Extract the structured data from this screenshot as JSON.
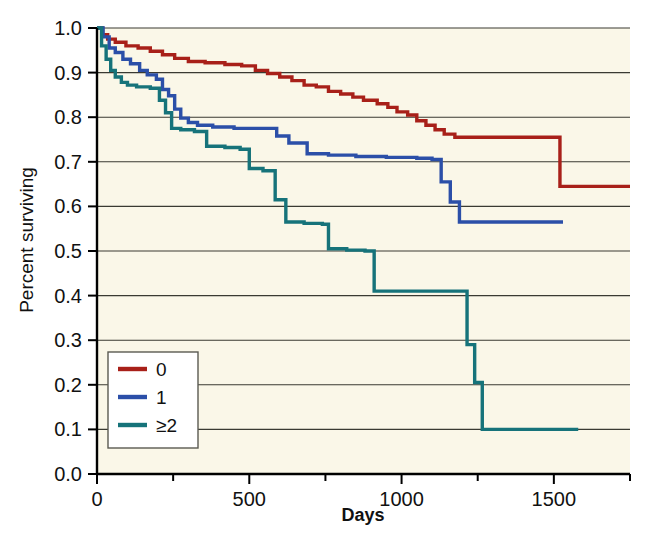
{
  "figure": {
    "background_color": "#ffffff",
    "plot_background_color": "#faf7e8"
  },
  "chart_data": {
    "type": "line",
    "subtype": "kaplan-meier-step",
    "title": "",
    "xlabel": "Days",
    "ylabel": "Percent surviving",
    "xlim": [
      0,
      1750
    ],
    "ylim": [
      0.0,
      1.0
    ],
    "grid": "horizontal",
    "xticks": [
      0,
      500,
      1000,
      1500
    ],
    "xtick_labels": [
      "0",
      "500",
      "1000",
      "1500"
    ],
    "xminor_ticks": [
      250,
      750,
      1250,
      1750
    ],
    "yticks": [
      0.0,
      0.1,
      0.2,
      0.3,
      0.4,
      0.5,
      0.6,
      0.7,
      0.8,
      0.9,
      1.0
    ],
    "ytick_labels": [
      "0.0",
      "0.1",
      "0.2",
      "0.3",
      "0.4",
      "0.5",
      "0.6",
      "0.7",
      "0.8",
      "0.9",
      "1.0"
    ],
    "legend_position": "lower-left",
    "legend_title": "",
    "series": [
      {
        "name": "0",
        "label": "0",
        "color": "#a82019",
        "final_value": 0.645,
        "steps": [
          [
            0,
            1.0
          ],
          [
            18,
            0.985
          ],
          [
            35,
            0.975
          ],
          [
            60,
            0.968
          ],
          [
            95,
            0.96
          ],
          [
            135,
            0.955
          ],
          [
            175,
            0.948
          ],
          [
            215,
            0.94
          ],
          [
            255,
            0.932
          ],
          [
            300,
            0.925
          ],
          [
            355,
            0.922
          ],
          [
            420,
            0.918
          ],
          [
            475,
            0.915
          ],
          [
            520,
            0.905
          ],
          [
            560,
            0.898
          ],
          [
            600,
            0.89
          ],
          [
            640,
            0.882
          ],
          [
            680,
            0.872
          ],
          [
            720,
            0.868
          ],
          [
            760,
            0.858
          ],
          [
            800,
            0.852
          ],
          [
            840,
            0.845
          ],
          [
            875,
            0.838
          ],
          [
            920,
            0.83
          ],
          [
            955,
            0.822
          ],
          [
            985,
            0.812
          ],
          [
            1020,
            0.805
          ],
          [
            1050,
            0.792
          ],
          [
            1080,
            0.782
          ],
          [
            1110,
            0.772
          ],
          [
            1140,
            0.762
          ],
          [
            1175,
            0.755
          ],
          [
            1520,
            0.645
          ],
          [
            1750,
            0.645
          ]
        ]
      },
      {
        "name": "1",
        "label": "1",
        "color": "#2b4fa8",
        "final_value": 0.565,
        "steps": [
          [
            0,
            1.0
          ],
          [
            20,
            0.98
          ],
          [
            40,
            0.955
          ],
          [
            60,
            0.945
          ],
          [
            85,
            0.93
          ],
          [
            110,
            0.92
          ],
          [
            140,
            0.905
          ],
          [
            165,
            0.895
          ],
          [
            195,
            0.885
          ],
          [
            215,
            0.862
          ],
          [
            235,
            0.848
          ],
          [
            255,
            0.818
          ],
          [
            275,
            0.798
          ],
          [
            300,
            0.788
          ],
          [
            330,
            0.782
          ],
          [
            380,
            0.778
          ],
          [
            450,
            0.775
          ],
          [
            560,
            0.775
          ],
          [
            590,
            0.758
          ],
          [
            630,
            0.742
          ],
          [
            690,
            0.718
          ],
          [
            760,
            0.715
          ],
          [
            850,
            0.712
          ],
          [
            950,
            0.71
          ],
          [
            1050,
            0.708
          ],
          [
            1100,
            0.705
          ],
          [
            1130,
            0.655
          ],
          [
            1160,
            0.61
          ],
          [
            1190,
            0.565
          ],
          [
            1530,
            0.565
          ]
        ]
      },
      {
        "name": "≥2",
        "label": "≥2",
        "color": "#16737a",
        "final_value": 0.1,
        "steps": [
          [
            0,
            1.0
          ],
          [
            15,
            0.96
          ],
          [
            30,
            0.93
          ],
          [
            45,
            0.905
          ],
          [
            60,
            0.89
          ],
          [
            80,
            0.878
          ],
          [
            100,
            0.872
          ],
          [
            130,
            0.868
          ],
          [
            175,
            0.865
          ],
          [
            205,
            0.838
          ],
          [
            225,
            0.81
          ],
          [
            245,
            0.775
          ],
          [
            275,
            0.772
          ],
          [
            320,
            0.768
          ],
          [
            360,
            0.735
          ],
          [
            420,
            0.732
          ],
          [
            470,
            0.728
          ],
          [
            500,
            0.685
          ],
          [
            545,
            0.68
          ],
          [
            585,
            0.615
          ],
          [
            620,
            0.565
          ],
          [
            680,
            0.562
          ],
          [
            740,
            0.56
          ],
          [
            760,
            0.505
          ],
          [
            820,
            0.502
          ],
          [
            880,
            0.5
          ],
          [
            910,
            0.41
          ],
          [
            1000,
            0.41
          ],
          [
            1100,
            0.41
          ],
          [
            1195,
            0.41
          ],
          [
            1215,
            0.29
          ],
          [
            1240,
            0.205
          ],
          [
            1265,
            0.1
          ],
          [
            1580,
            0.1
          ]
        ]
      }
    ]
  },
  "legend": {
    "entries": [
      {
        "label": "0",
        "color": "#a82019"
      },
      {
        "label": "1",
        "color": "#2b4fa8"
      },
      {
        "label": "≥2",
        "color": "#16737a"
      }
    ]
  },
  "axes": {
    "x_title": "Days",
    "y_title": "Percent surviving"
  }
}
